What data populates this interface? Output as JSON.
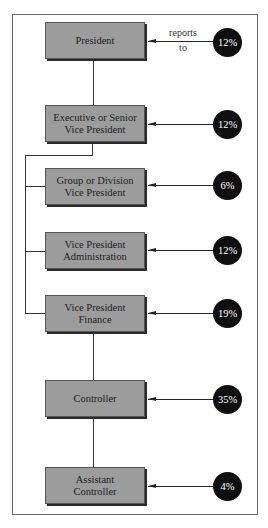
{
  "diagram": {
    "type": "org-chart",
    "annotation": {
      "line1": "reports",
      "line2": "to"
    },
    "positions": [
      {
        "title_line1": "President",
        "title_line2": "",
        "percent": "12%"
      },
      {
        "title_line1": "Executive or Senior",
        "title_line2": "Vice President",
        "percent": "12%"
      },
      {
        "title_line1": "Group or Division",
        "title_line2": "Vice President",
        "percent": "6%"
      },
      {
        "title_line1": "Vice President",
        "title_line2": "Administration",
        "percent": "12%"
      },
      {
        "title_line1": "Vice President",
        "title_line2": "Finance",
        "percent": "19%"
      },
      {
        "title_line1": "Controller",
        "title_line2": "",
        "percent": "35%"
      },
      {
        "title_line1": "Assistant",
        "title_line2": "Controller",
        "percent": "4%"
      }
    ]
  }
}
